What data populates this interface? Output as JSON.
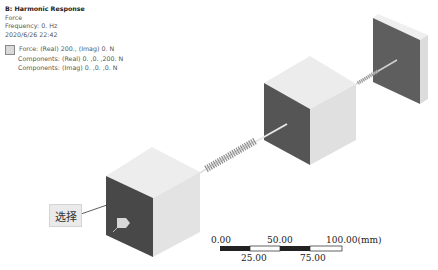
{
  "legend": {
    "title": "B: Harmonic Response",
    "subtitle": "Force",
    "frequency": "Frequency: 0. Hz",
    "timestamp": "2020/6/26 22:42",
    "entry_line1": "Force: (Real) 200., (Imag) 0. N",
    "entry_line2": "Components: (Real) 0. ,0. ,200. N",
    "entry_line3": "Components: (Imag) 0. ,0. ,0. N",
    "swatch_color": "#d9d9d9"
  },
  "annotation": {
    "label": "选择"
  },
  "scale_bar": {
    "top_labels": [
      "0.00",
      "50.00",
      "100.00(mm)"
    ],
    "bottom_labels": [
      "25.00",
      "75.00"
    ]
  },
  "colors": {
    "cube_top": "#ececec",
    "cube_front_dark": "#4a4a4a",
    "cube_side": "#e2e2e2",
    "wall_face": "#5e5e5e"
  }
}
